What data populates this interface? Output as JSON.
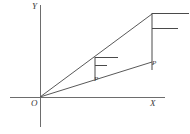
{
  "figure": {
    "type": "geometry-diagram",
    "background_color": "#ffffff",
    "line_color": "#595959",
    "axis_color": "#6d6d6d",
    "label_color": "#3a3a3a",
    "axes": {
      "y_axis": {
        "label": "Y",
        "x": 40,
        "y_top": 5,
        "y_bottom": 127
      },
      "x_axis": {
        "label": "X",
        "y": 97,
        "x_left": 10,
        "x_right": 165
      },
      "origin": {
        "label": "O",
        "x": 40,
        "y": 97
      }
    },
    "rays": [
      {
        "name": "upper-ray",
        "from_x": 40,
        "from_y": 97,
        "to_x": 152,
        "to_y": 14
      },
      {
        "name": "lower-ray",
        "from_x": 40,
        "from_y": 97,
        "to_x": 152,
        "to_y": 62
      }
    ],
    "verticals": [
      {
        "name": "inner-vertical",
        "x": 95,
        "y_top": 57,
        "y_bottom": 79
      },
      {
        "name": "outer-vertical",
        "x": 152,
        "y_top": 13,
        "y_bottom": 70
      }
    ],
    "ticks": [
      {
        "name": "inner-upper-tick",
        "x_start": 95,
        "x_end": 118,
        "y": 57
      },
      {
        "name": "inner-lower-tick",
        "x_start": 95,
        "x_end": 107,
        "y": 65
      },
      {
        "name": "outer-upper-tick",
        "x_start": 152,
        "x_end": 189,
        "y": 13
      },
      {
        "name": "outer-lower-tick",
        "x_start": 152,
        "x_end": 178,
        "y": 28
      }
    ],
    "points": [
      {
        "name": "inner-point",
        "label": "P",
        "x": 95,
        "y": 79
      },
      {
        "name": "outer-point",
        "label": "P",
        "x": 152,
        "y": 62
      }
    ]
  }
}
